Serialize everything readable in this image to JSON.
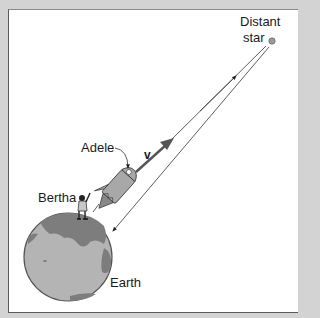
{
  "figure": {
    "labels": {
      "distant_star_line1": "Distant",
      "distant_star_line2": "star",
      "adele": "Adele",
      "velocity": "v",
      "bertha": "Bertha",
      "earth": "Earth"
    },
    "colors": {
      "background": "#d3d3d3",
      "panel": "#ffffff",
      "earth_ocean": "#b4b4b4",
      "earth_land": "#7d7d7d",
      "star": "#9a9a9a",
      "rocket": "#a8a8a8",
      "line": "#333333"
    },
    "icons": {
      "star": "distant-star-dot",
      "rocket": "rocket-ship",
      "person": "bertha-figure",
      "planet": "earth-globe"
    }
  }
}
